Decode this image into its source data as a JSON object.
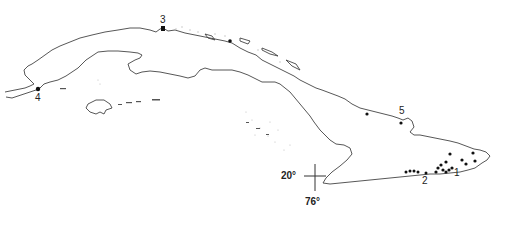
{
  "map": {
    "subject": "Cuba",
    "colors": {
      "coast": "#444444",
      "dots": "#111111",
      "stipple": "#bbbbbb",
      "background": "#ffffff"
    },
    "localities": [
      {
        "id": "1",
        "label": "1",
        "x": 457,
        "y": 172
      },
      {
        "id": "2",
        "label": "2",
        "x": 425,
        "y": 180
      },
      {
        "id": "3",
        "label": "3",
        "x": 163,
        "y": 20
      },
      {
        "id": "4",
        "label": "4",
        "x": 38,
        "y": 98
      },
      {
        "id": "5",
        "label": "5",
        "x": 402,
        "y": 110
      }
    ],
    "reference_cross": {
      "lat_label": "20°",
      "lon_label": "76°",
      "x": 315,
      "y": 176
    }
  }
}
